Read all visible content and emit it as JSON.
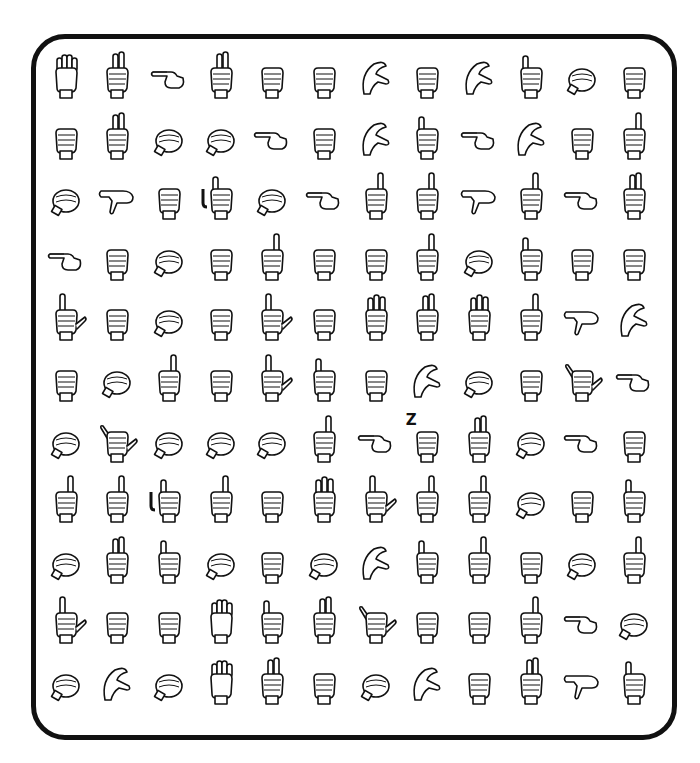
{
  "puzzle": {
    "type": "ASL fingerspelling letter grid",
    "columns": 12,
    "rows": 11,
    "annotations": [
      {
        "row": 7,
        "col": 8,
        "text": "Z"
      }
    ],
    "grid": [
      [
        "B",
        "R",
        "G",
        "R",
        "E",
        "E",
        "C",
        "E",
        "C",
        "I",
        "O",
        "S"
      ],
      [
        "S",
        "V",
        "O",
        "O",
        "H",
        "A",
        "C",
        "I",
        "H",
        "C",
        "E",
        "D"
      ],
      [
        "O",
        "P",
        "A",
        "J",
        "O",
        "H",
        "D",
        "D",
        "P",
        "D",
        "H",
        "U"
      ],
      [
        "G",
        "E",
        "O",
        "A",
        "D",
        "E",
        "A",
        "D",
        "O",
        "I",
        "A",
        "A"
      ],
      [
        "L",
        "E",
        "O",
        "A",
        "L",
        "A",
        "W",
        "V",
        "W",
        "D",
        "P",
        "C"
      ],
      [
        "A",
        "O",
        "X",
        "A",
        "L",
        "I",
        "A",
        "C",
        "O",
        "E",
        "Y",
        "H"
      ],
      [
        "O",
        "Y",
        "O",
        "O",
        "O",
        "D",
        "G",
        "A",
        "U",
        "O",
        "G",
        "A"
      ],
      [
        "D",
        "D",
        "J",
        "D",
        "A",
        "W",
        "L",
        "Z",
        "D",
        "O",
        "E",
        "I"
      ],
      [
        "O",
        "U",
        "I",
        "O",
        "E",
        "O",
        "C",
        "I",
        "D",
        "A",
        "O",
        "D"
      ],
      [
        "L",
        "A",
        "A",
        "B",
        "I",
        "V",
        "Y",
        "E",
        "A",
        "D",
        "H",
        "O"
      ],
      [
        "O",
        "C",
        "O",
        "B",
        "R",
        "A",
        "O",
        "C",
        "E",
        "V",
        "P",
        "I"
      ]
    ]
  }
}
